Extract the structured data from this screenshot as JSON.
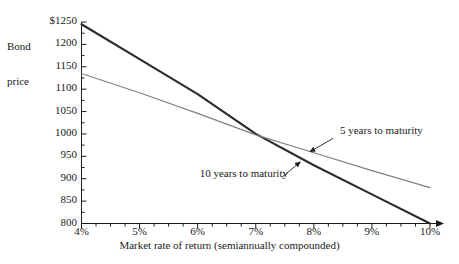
{
  "chart_data": {
    "type": "line",
    "title": "",
    "subtitle": "",
    "xlabel": "Market rate of return (semiannually compounded)",
    "ylabel": "Bond price",
    "ylabel_line1": "Bond",
    "ylabel_line2": "price",
    "xlim": [
      4,
      10
    ],
    "ylim": [
      800,
      1250
    ],
    "grid": false,
    "legend_position": "inline-annotations",
    "x_tick_labels": [
      "4%",
      "5%",
      "6%",
      "7%",
      "8%",
      "9%",
      "10%"
    ],
    "x_tick_values": [
      4,
      5,
      6,
      7,
      8,
      9,
      10
    ],
    "x_minor_tick_values": [
      4.25,
      4.5,
      4.75,
      5.25,
      5.5,
      5.75,
      6.25,
      6.5,
      6.75,
      7.25,
      7.5,
      7.75,
      8.25,
      8.5,
      8.75,
      9.25,
      9.5,
      9.75
    ],
    "y_tick_labels": [
      "800",
      "850",
      "900",
      "950",
      "1000",
      "1050",
      "1100",
      "1150",
      "1200",
      "$1250"
    ],
    "y_tick_values": [
      800,
      850,
      900,
      950,
      1000,
      1050,
      1100,
      1150,
      1200,
      1250
    ],
    "y_minor_tick_values": [
      825,
      875,
      925,
      975,
      1025,
      1075,
      1125,
      1175,
      1225
    ],
    "series": [
      {
        "name": "10 years to maturity",
        "color": "#2b2b2b",
        "width": 2.1,
        "x": [
          4,
          5,
          6,
          7,
          8,
          9,
          10
        ],
        "values": [
          1245,
          1167,
          1089,
          1000,
          930,
          865,
          800
        ]
      },
      {
        "name": "5 years to maturity",
        "color": "#808080",
        "width": 1.2,
        "x": [
          4,
          5,
          6,
          7,
          8,
          9,
          10
        ],
        "values": [
          1135,
          1092,
          1046,
          998,
          958,
          918,
          880
        ]
      }
    ],
    "annotations": [
      {
        "text": "5 years to maturity",
        "label_x": 8.45,
        "label_y": 1005,
        "arrow_from_x": 8.33,
        "arrow_from_y": 990,
        "arrow_to_x": 7.93,
        "arrow_to_y": 960
      },
      {
        "text": "10 years to maturity",
        "label_x": 6.0,
        "label_y": 908,
        "arrow_from_x": 7.45,
        "arrow_from_y": 903,
        "arrow_to_x": 7.77,
        "arrow_to_y": 938
      }
    ],
    "intersection": {
      "x": 7,
      "y": 1000
    }
  }
}
